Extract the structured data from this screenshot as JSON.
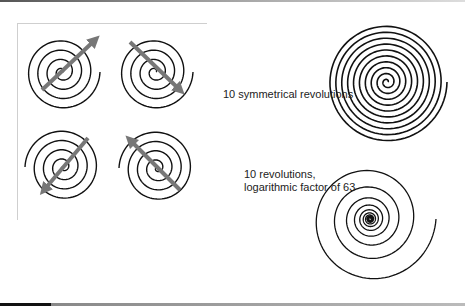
{
  "diagram": {
    "labels": {
      "symmetrical": "10 symmetrical revolutions",
      "logarithmic_line1": "10 revolutions,",
      "logarithmic_line2": "logarithmic factor of 63"
    },
    "colors": {
      "spiral_stroke": "#111111",
      "arrow": "#777777",
      "frame": "#cfcfcf"
    },
    "spirals": [
      {
        "id": "small-1",
        "arrow_direction": "up-right"
      },
      {
        "id": "small-2",
        "arrow_direction": "down-right"
      },
      {
        "id": "small-3",
        "arrow_direction": "down-left"
      },
      {
        "id": "small-4",
        "arrow_direction": "up-left"
      },
      {
        "id": "large-symmetrical",
        "revolutions": 10
      },
      {
        "id": "large-logarithmic",
        "revolutions": 10,
        "log_factor": 63
      }
    ]
  }
}
